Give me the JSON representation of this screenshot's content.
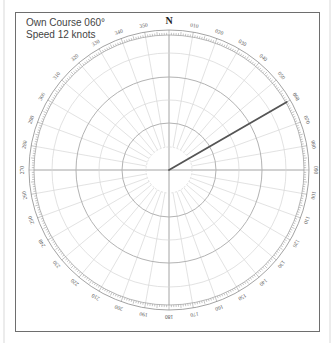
{
  "info": {
    "course_line": "Own Course 060°",
    "speed_line": "Speed 12 knots"
  },
  "plot": {
    "center": [
      169,
      170
    ],
    "outer_radius": 140,
    "tick_inner_radius": 135,
    "ring_radii": [
      23,
      47,
      70,
      93,
      117
    ],
    "strong_rings": [
      47,
      93
    ],
    "radial_step_deg": 10,
    "north_label": "N",
    "bearing_labels": [
      "010",
      "020",
      "030",
      "040",
      "050",
      "060",
      "070",
      "080",
      "090",
      "100",
      "110",
      "120",
      "130",
      "140",
      "150",
      "160",
      "170",
      "180",
      "190",
      "200",
      "210",
      "220",
      "230",
      "240",
      "250",
      "260",
      "270",
      "280",
      "290",
      "300",
      "310",
      "320",
      "330",
      "340",
      "350"
    ],
    "own_course_deg": 60,
    "course_line_length": 136,
    "colors": {
      "grid": "#d6d6d6",
      "grid_strong": "#b3b3b3",
      "axis": "#9a9a9a",
      "tick": "#8c8c8c",
      "label": "#555555",
      "course": "#555555",
      "frame": "#6e6e6e"
    }
  }
}
